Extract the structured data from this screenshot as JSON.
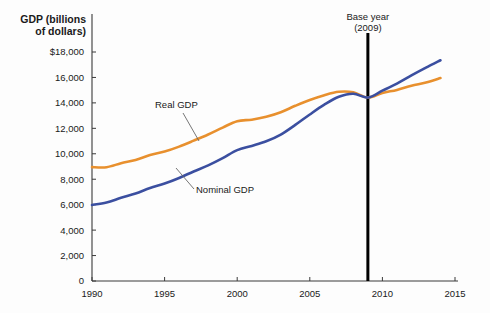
{
  "chart_data": {
    "type": "line",
    "title": "",
    "xlabel": "",
    "ylabel": "GDP (billions of dollars)",
    "ylabel_line1": "GDP (billions",
    "ylabel_line2": "of dollars)",
    "xlim": [
      1990,
      2015
    ],
    "ylim": [
      0,
      18000
    ],
    "grid": false,
    "legend_position": "inline-annotations",
    "xticks": [
      1990,
      1995,
      2000,
      2005,
      2010,
      2015
    ],
    "xtick_labels": [
      "1990",
      "1995",
      "2000",
      "2005",
      "2010",
      "2015"
    ],
    "yticks": [
      0,
      2000,
      4000,
      6000,
      8000,
      10000,
      12000,
      14000,
      16000,
      18000
    ],
    "ytick_labels": [
      "0",
      "2,000",
      "4,000",
      "6,000",
      "8,000",
      "10,000",
      "12,000",
      "14,000",
      "16,000",
      "$18,000"
    ],
    "x": [
      1990,
      1991,
      1992,
      1993,
      1994,
      1995,
      1996,
      1997,
      1998,
      1999,
      2000,
      2001,
      2002,
      2003,
      2004,
      2005,
      2006,
      2007,
      2008,
      2009,
      2010,
      2011,
      2012,
      2013,
      2014
    ],
    "series": [
      {
        "name": "Real GDP",
        "label": "Real GDP",
        "color": "#E8902E",
        "values": [
          8950,
          8940,
          9260,
          9520,
          9900,
          10170,
          10560,
          11030,
          11520,
          12060,
          12560,
          12680,
          12910,
          13270,
          13770,
          14230,
          14610,
          14870,
          14830,
          14420,
          14780,
          15020,
          15350,
          15600,
          15950
        ]
      },
      {
        "name": "Nominal GDP",
        "label": "Nominal GDP",
        "color": "#3B4FA0",
        "values": [
          5980,
          6170,
          6540,
          6880,
          7310,
          7660,
          8100,
          8610,
          9090,
          9660,
          10290,
          10620,
          10980,
          11510,
          12270,
          13090,
          13860,
          14480,
          14720,
          14420,
          14960,
          15520,
          16160,
          16770,
          17350
        ]
      }
    ],
    "annotations": [
      {
        "name": "base-year",
        "line1": "Base year",
        "line2": "(2009)",
        "x": 2009,
        "color": "#000000"
      }
    ]
  }
}
